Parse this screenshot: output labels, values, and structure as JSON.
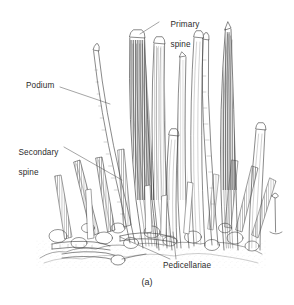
{
  "figure": {
    "caption": "(a)",
    "background_color": "#ffffff",
    "ink_color": "#3a3a3a",
    "text_color": "#2b2b2b"
  },
  "labels": {
    "primary_spine": "Primary\nspine",
    "primary_spine_line1": "Primary",
    "primary_spine_line2": "spine",
    "podium": "Podium",
    "secondary_spine": "Secondary\nspine",
    "secondary_spine_line1": "Secondary",
    "secondary_spine_line2": "spine",
    "pedicellariae": "Pedicellariae"
  },
  "leaders": {
    "primary_spine": [
      [
        160,
        22
      ],
      [
        140,
        34
      ]
    ],
    "podium": [
      [
        60,
        87
      ],
      [
        110,
        104
      ]
    ],
    "secondary_spine": [
      [
        64,
        147
      ],
      [
        122,
        180
      ]
    ],
    "pedicellariae_a": [
      [
        176,
        259
      ],
      [
        173,
        232
      ]
    ],
    "pedicellariae_b": [
      [
        170,
        259
      ],
      [
        120,
        236
      ]
    ]
  },
  "structures": {
    "primary_spines": 7,
    "secondary_spines": 12,
    "podia": 2,
    "pedicellariae": 4
  }
}
